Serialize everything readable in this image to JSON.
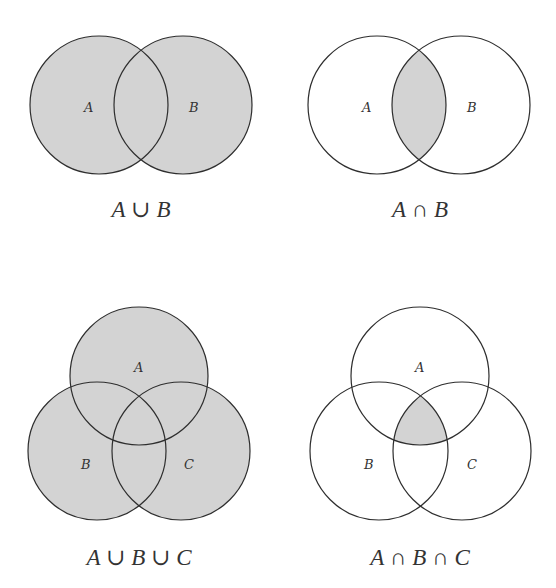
{
  "colors": {
    "fill": "#d3d3d3",
    "stroke": "#2e2e2e",
    "text": "#333333",
    "background": "#ffffff"
  },
  "diagrams": [
    {
      "caption": "A ∪ B",
      "caption_parts": [
        "A",
        " ∪ ",
        "B"
      ],
      "operation": "union",
      "sets": [
        {
          "label": "A",
          "cx": 99,
          "cy": 105,
          "r": 69
        },
        {
          "label": "B",
          "cx": 183,
          "cy": 105,
          "r": 69
        }
      ],
      "shaded_region": "A ∪ B"
    },
    {
      "caption": "A ∩ B",
      "caption_parts": [
        "A",
        " ∩ ",
        "B"
      ],
      "operation": "intersection",
      "sets": [
        {
          "label": "A",
          "cx": 377,
          "cy": 105,
          "r": 69
        },
        {
          "label": "B",
          "cx": 461,
          "cy": 105,
          "r": 69
        }
      ],
      "shaded_region": "A ∩ B"
    },
    {
      "caption": "A ∪ B ∪ C",
      "caption_parts": [
        "A",
        " ∪ ",
        "B",
        " ∪ ",
        "C"
      ],
      "operation": "union",
      "sets": [
        {
          "label": "A",
          "cx": 139,
          "cy": 376,
          "r": 69
        },
        {
          "label": "B",
          "cx": 97,
          "cy": 451,
          "r": 69
        },
        {
          "label": "C",
          "cx": 181,
          "cy": 451,
          "r": 69
        }
      ],
      "shaded_region": "A ∪ B ∪ C"
    },
    {
      "caption": "A ∩ B ∩ C",
      "caption_parts": [
        "A",
        " ∩ ",
        "B",
        " ∩ ",
        "C"
      ],
      "operation": "intersection",
      "sets": [
        {
          "label": "A",
          "cx": 420,
          "cy": 376,
          "r": 69
        },
        {
          "label": "B",
          "cx": 379,
          "cy": 451,
          "r": 69
        },
        {
          "label": "C",
          "cx": 462,
          "cy": 451,
          "r": 69
        }
      ],
      "shaded_region": "A ∩ B ∩ C"
    }
  ]
}
